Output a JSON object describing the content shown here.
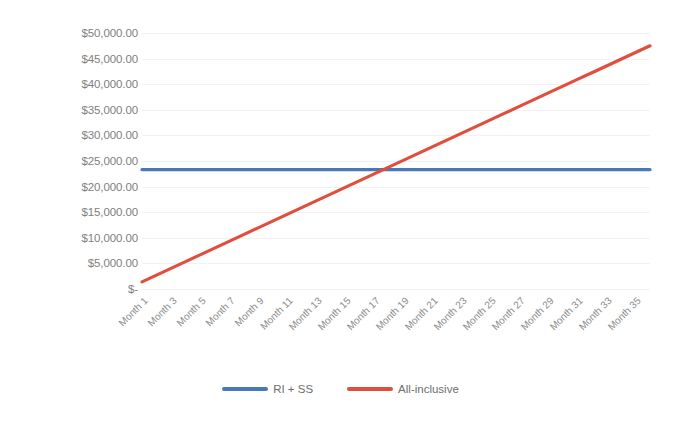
{
  "chart_data": {
    "type": "line",
    "title": "",
    "xlabel": "",
    "ylabel": "",
    "grid": true,
    "legend_position": "bottom",
    "ylim": [
      0,
      50000
    ],
    "y_ticks": [
      0,
      5000,
      10000,
      15000,
      20000,
      25000,
      30000,
      35000,
      40000,
      45000,
      50000
    ],
    "y_tick_labels": [
      "$-",
      "$5,000.00",
      "$10,000.00",
      "$15,000.00",
      "$20,000.00",
      "$25,000.00",
      "$30,000.00",
      "$35,000.00",
      "$40,000.00",
      "$45,000.00",
      "$50,000.00"
    ],
    "x": [
      1,
      2,
      3,
      4,
      5,
      6,
      7,
      8,
      9,
      10,
      11,
      12,
      13,
      14,
      15,
      16,
      17,
      18,
      19,
      20,
      21,
      22,
      23,
      24,
      25,
      26,
      27,
      28,
      29,
      30,
      31,
      32,
      33,
      34,
      35,
      36
    ],
    "categories": [
      "Month 1",
      "Month 2",
      "Month 3",
      "Month 4",
      "Month 5",
      "Month 6",
      "Month 7",
      "Month 8",
      "Month 9",
      "Month 10",
      "Month 11",
      "Month 12",
      "Month 13",
      "Month 14",
      "Month 15",
      "Month 16",
      "Month 17",
      "Month 18",
      "Month 19",
      "Month 20",
      "Month 21",
      "Month 22",
      "Month 23",
      "Month 24",
      "Month 25",
      "Month 26",
      "Month 27",
      "Month 28",
      "Month 29",
      "Month 30",
      "Month 31",
      "Month 32",
      "Month 33",
      "Month 34",
      "Month 35",
      "Month 36"
    ],
    "x_tick_labels": [
      "Month 1",
      "Month 3",
      "Month 5",
      "Month 7",
      "Month 9",
      "Month 11",
      "Month 13",
      "Month 15",
      "Month 17",
      "Month 19",
      "Month 21",
      "Month 23",
      "Month 25",
      "Month 27",
      "Month 29",
      "Month 31",
      "Month 33",
      "Month 35"
    ],
    "x_tick_values": [
      1,
      3,
      5,
      7,
      9,
      11,
      13,
      15,
      17,
      19,
      21,
      23,
      25,
      27,
      29,
      31,
      33,
      35
    ],
    "series": [
      {
        "name": "RI + SS",
        "color": "#4878b8",
        "values": [
          23300,
          23300,
          23300,
          23300,
          23300,
          23300,
          23300,
          23300,
          23300,
          23300,
          23300,
          23300,
          23300,
          23300,
          23300,
          23300,
          23300,
          23300,
          23300,
          23300,
          23300,
          23300,
          23300,
          23300,
          23300,
          23300,
          23300,
          23300,
          23300,
          23300,
          23300,
          23300,
          23300,
          23300,
          23300,
          23300
        ]
      },
      {
        "name": "All-inclusive",
        "color": "#e04f3d",
        "values": [
          1400,
          2718,
          4036,
          5354,
          6671,
          7989,
          9307,
          10625,
          11943,
          13260,
          14578,
          15896,
          17214,
          18531,
          19849,
          21167,
          22485,
          23803,
          25120,
          26438,
          27756,
          29074,
          30391,
          31709,
          33027,
          34345,
          35663,
          36980,
          38298,
          39616,
          40934,
          42251,
          43569,
          44887,
          46205,
          47500
        ]
      }
    ]
  },
  "legend": {
    "items": [
      {
        "label": "RI + SS",
        "color": "#4878b8"
      },
      {
        "label": "All-inclusive",
        "color": "#e04f3d"
      }
    ]
  }
}
